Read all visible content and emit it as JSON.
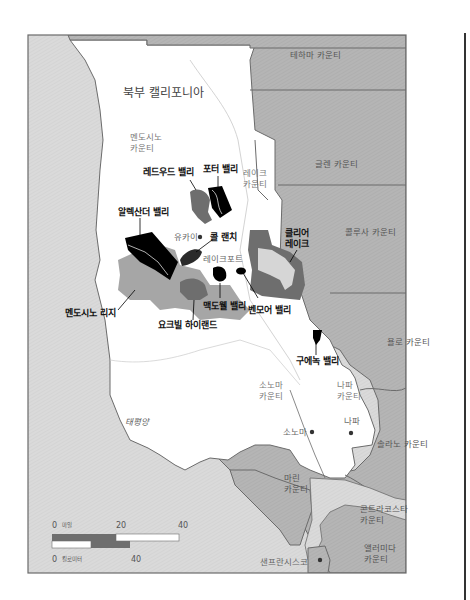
{
  "map": {
    "region_title": "북부 캘리포니아",
    "ocean_label": "태평양",
    "counties": {
      "tehama": "테하마 카운티",
      "glenn": "글렌 카운티",
      "colusa": "콜루사 카운티",
      "yolo": "욜로 카운티",
      "solano": "솔라노 카운티",
      "mendocino_1": "멘도시노",
      "mendocino_2": "카운티",
      "lake_1": "레이크",
      "lake_2": "카운티",
      "sonoma_1": "소노마",
      "sonoma_2": "카운티",
      "napa_1": "나파",
      "napa_2": "카운티",
      "marin_1": "마린",
      "marin_2": "카운티",
      "contra_costa_1": "콘트라코스타",
      "contra_costa_2": "카운티",
      "alameda_1": "앨러미다",
      "alameda_2": "카운티"
    },
    "towns": {
      "ukiah": "유카이",
      "lakeport": "레이크포트",
      "sonoma": "소노마",
      "napa": "나파",
      "san_francisco": "샌프란시스코"
    },
    "avas": {
      "redwood_valley": "레드우드 밸리",
      "potter_valley": "포터 밸리",
      "alexander_valley": "알렉산더 밸리",
      "cole_ranch": "콜 랜치",
      "clear_lake_1": "클리어",
      "clear_lake_2": "레이크",
      "mendocino_ridge": "멘도시노 리지",
      "mcdowell_valley": "맥도웰 밸리",
      "benmore_valley": "벤모어 밸리",
      "yorkville_highlands": "요크빌 하이랜드",
      "guenoc_valley": "구에녹 밸리"
    },
    "scale": {
      "mile_zero": "0",
      "mile_unit": "마일",
      "mile_mid": "20",
      "mile_max": "40",
      "km_zero": "0",
      "km_unit": "킬로미터",
      "km_max": "40"
    },
    "colors": {
      "ocean": "#d9d9d9",
      "land_other": "#b3b3b3",
      "land_focus": "#ffffff",
      "ava_dark": "#000000",
      "ava_mid": "#6e6e6e",
      "ava_light": "#a6a6a6",
      "border": "#6b6b6b"
    }
  }
}
